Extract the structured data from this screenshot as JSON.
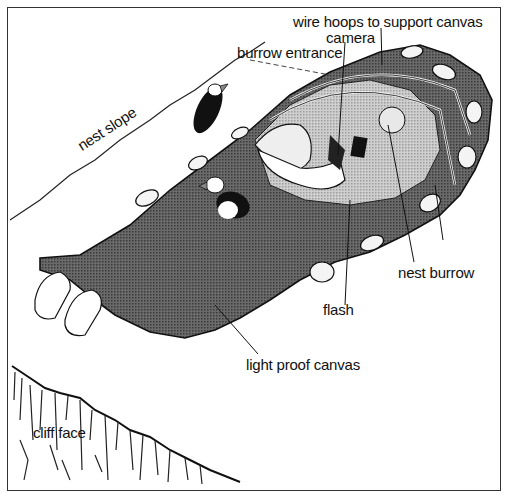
{
  "diagram": {
    "labels": {
      "wire_hoops": "wire hoops to support canvas",
      "camera": "camera",
      "burrow_entrance": "burrow entrance",
      "nest_slope": "nest slope",
      "nest_burrow": "nest burrow",
      "flash": "flash",
      "light_proof_canvas": "light proof canvas",
      "cliff_face": "cliff face"
    },
    "colors": {
      "canvas": "#555555",
      "window": "#b8b8b8",
      "ink": "#111111",
      "rock": "#f4f4f4"
    }
  }
}
